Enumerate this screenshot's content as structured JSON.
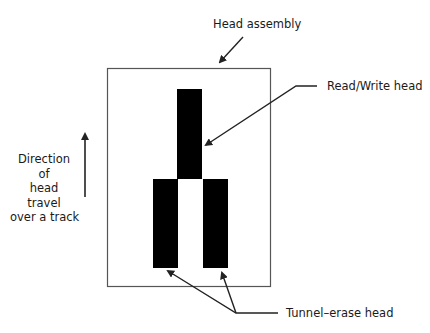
{
  "diagram": {
    "labels": {
      "head_assembly": "Head assembly",
      "read_write_head": "Read/Write head",
      "tunnel_erase_head": "Tunnel–erase head",
      "direction": [
        "Direction",
        "of",
        "head",
        "travel",
        "over a track"
      ]
    },
    "colors": {
      "heads": "#000000",
      "outline": "#555555",
      "arrows": "#222222"
    }
  }
}
